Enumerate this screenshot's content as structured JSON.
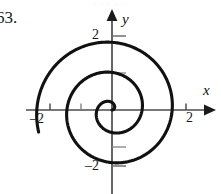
{
  "figure": {
    "problem_number": "63.",
    "bleed_text": "· ·  ·   ·· ·",
    "axes": {
      "x_label": "x",
      "y_label": "y",
      "x_tick_positive": "2",
      "x_tick_negative": "–2",
      "y_tick_positive": "2",
      "y_tick_negative": "–2"
    }
  },
  "chart_data": {
    "type": "line",
    "title": "",
    "xlabel": "x",
    "ylabel": "y",
    "xlim": [
      -2.9,
      2.9
    ],
    "ylim": [
      -2.4,
      2.6
    ],
    "grid": false,
    "legend": null,
    "curve_name": "Archimedean spiral",
    "polar_equation": "r = aθ",
    "theta_start": 0,
    "theta_end": 16.0,
    "a": 0.1294,
    "origin_px": [
      112,
      110
    ],
    "pixels_per_unit": 37,
    "x_ticks": [
      -2,
      -1,
      2
    ],
    "y_ticks": [
      -2,
      -1,
      1,
      2
    ],
    "x_tick_labels": [
      "–2",
      "",
      "2"
    ],
    "y_tick_labels": [
      "–2",
      "",
      "",
      "2"
    ],
    "axis_crossings": {
      "positive_x": [
        0.41,
        1.22,
        2.03
      ],
      "negative_x": [
        -0.81,
        -1.62
      ],
      "positive_y": [
        0.61,
        1.42,
        2.23
      ],
      "negative_y": [
        -0.2,
        -1.02,
        -1.83
      ]
    }
  }
}
